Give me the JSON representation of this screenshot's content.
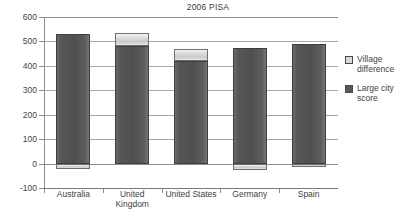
{
  "chart_data": {
    "type": "bar",
    "title": "2006 PISA",
    "xlabel": "",
    "ylabel": "",
    "ylim": [
      -100,
      600
    ],
    "ytick_values": [
      600,
      500,
      400,
      300,
      200,
      100,
      0,
      -100
    ],
    "ytick_labels": [
      "600",
      "500",
      "400",
      "300",
      "200",
      "100",
      "0",
      "-100"
    ],
    "grid": true,
    "stacked": true,
    "legend_position": "right",
    "categories": [
      "Australia",
      "United Kingdom",
      "United States",
      "Germany",
      "Spain"
    ],
    "category_label_lines": [
      [
        "Australia"
      ],
      [
        "United",
        "Kingdom"
      ],
      [
        "United States"
      ],
      [
        "Germany"
      ],
      [
        "Spain"
      ]
    ],
    "series": [
      {
        "name": "Large city score",
        "color": "#585858",
        "values": [
          531,
          480,
          421,
          472,
          488
        ]
      },
      {
        "name": "Village difference",
        "color": "#d8d8d8",
        "values": [
          -21,
          55,
          48,
          -25,
          -15
        ]
      }
    ],
    "bars": [
      {
        "category": "Australia",
        "large_city_score": 531,
        "village_difference": -21,
        "dark_from": 0,
        "dark_to": 531,
        "light_from": 0,
        "light_to": -21
      },
      {
        "category": "United Kingdom",
        "large_city_score": 480,
        "village_difference": 55,
        "dark_from": 0,
        "dark_to": 480,
        "light_from": 480,
        "light_to": 535
      },
      {
        "category": "United States",
        "large_city_score": 421,
        "village_difference": 48,
        "dark_from": 0,
        "dark_to": 421,
        "light_from": 421,
        "light_to": 469
      },
      {
        "category": "Germany",
        "large_city_score": 472,
        "village_difference": -25,
        "dark_from": 0,
        "dark_to": 472,
        "light_from": 0,
        "light_to": -25
      },
      {
        "category": "Spain",
        "large_city_score": 488,
        "village_difference": -15,
        "dark_from": 0,
        "dark_to": 488,
        "light_from": 0,
        "light_to": -15
      }
    ]
  },
  "legend": {
    "items": [
      {
        "label": "Village difference",
        "swatch": "light"
      },
      {
        "label": "Large city score",
        "swatch": "dark"
      }
    ]
  }
}
